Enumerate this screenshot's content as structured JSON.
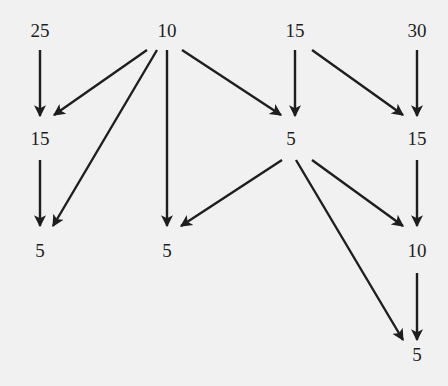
{
  "diagram": {
    "type": "directed-graph",
    "colors": {
      "background": "#f1f1f1",
      "ink": "#1e1e1e"
    },
    "nodes": [
      {
        "id": "n25",
        "label": "25",
        "x": 40,
        "y": 33
      },
      {
        "id": "n10a",
        "label": "10",
        "x": 167,
        "y": 33
      },
      {
        "id": "n15a",
        "label": "15",
        "x": 295,
        "y": 33
      },
      {
        "id": "n30",
        "label": "30",
        "x": 417,
        "y": 33
      },
      {
        "id": "n15b",
        "label": "15",
        "x": 40,
        "y": 141
      },
      {
        "id": "n5a",
        "label": "5",
        "x": 291,
        "y": 141
      },
      {
        "id": "n15c",
        "label": "15",
        "x": 417,
        "y": 141
      },
      {
        "id": "n5b",
        "label": "5",
        "x": 40,
        "y": 253
      },
      {
        "id": "n5c",
        "label": "5",
        "x": 167,
        "y": 253
      },
      {
        "id": "n10b",
        "label": "10",
        "x": 417,
        "y": 253
      },
      {
        "id": "n5d",
        "label": "5",
        "x": 417,
        "y": 357
      }
    ],
    "edges": [
      {
        "from": "n25",
        "to": "n15b",
        "x1": 40,
        "y1": 50,
        "x2": 40,
        "y2": 116
      },
      {
        "from": "n10a",
        "to": "n15b",
        "x1": 147,
        "y1": 50,
        "x2": 54,
        "y2": 115
      },
      {
        "from": "n10a",
        "to": "n5b",
        "x1": 157,
        "y1": 50,
        "x2": 53,
        "y2": 226
      },
      {
        "from": "n10a",
        "to": "n5c",
        "x1": 167,
        "y1": 50,
        "x2": 167,
        "y2": 226
      },
      {
        "from": "n10a",
        "to": "n5a",
        "x1": 182,
        "y1": 50,
        "x2": 281,
        "y2": 115
      },
      {
        "from": "n15a",
        "to": "n5a",
        "x1": 295,
        "y1": 50,
        "x2": 295,
        "y2": 116
      },
      {
        "from": "n15a",
        "to": "n15c",
        "x1": 312,
        "y1": 50,
        "x2": 403,
        "y2": 115
      },
      {
        "from": "n30",
        "to": "n15c",
        "x1": 417,
        "y1": 50,
        "x2": 417,
        "y2": 116
      },
      {
        "from": "n15b",
        "to": "n5b",
        "x1": 40,
        "y1": 160,
        "x2": 40,
        "y2": 226
      },
      {
        "from": "n5a",
        "to": "n5c",
        "x1": 282,
        "y1": 160,
        "x2": 181,
        "y2": 226
      },
      {
        "from": "n5a",
        "to": "n5d",
        "x1": 296,
        "y1": 160,
        "x2": 403,
        "y2": 340
      },
      {
        "from": "n5a",
        "to": "n10b",
        "x1": 312,
        "y1": 160,
        "x2": 403,
        "y2": 226
      },
      {
        "from": "n15c",
        "to": "n10b",
        "x1": 417,
        "y1": 160,
        "x2": 417,
        "y2": 226
      },
      {
        "from": "n10b",
        "to": "n5d",
        "x1": 417,
        "y1": 273,
        "x2": 417,
        "y2": 340
      }
    ]
  }
}
